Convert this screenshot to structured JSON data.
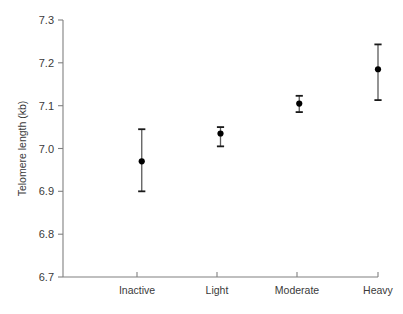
{
  "chart_data": {
    "type": "scatter",
    "title": "",
    "xlabel": "",
    "ylabel": "Telomere length (kb)",
    "categories": [
      "Inactive",
      "Light",
      "Moderate",
      "Heavy"
    ],
    "values": [
      6.97,
      7.035,
      7.105,
      7.185
    ],
    "error_low": [
      6.9,
      7.005,
      7.085,
      7.113
    ],
    "error_high": [
      7.045,
      7.05,
      7.123,
      7.243
    ],
    "ylim": [
      6.7,
      7.3
    ],
    "yticks": [
      6.7,
      6.8,
      6.9,
      7.0,
      7.1,
      7.2,
      7.3
    ],
    "ytick_labels": [
      "6.7",
      "6.8",
      "6.9",
      "7.0",
      "7.1",
      "7.2",
      "7.3"
    ],
    "grid": false,
    "legend": false,
    "marker": "filled-circle",
    "marker_color": "#000000",
    "errorbar_color": "#5a5a5a",
    "axis_color": "#808080",
    "background": "#ffffff",
    "spines": [
      "left",
      "bottom"
    ]
  },
  "axis": {
    "y_title": "Telomere length (kb)"
  },
  "ticks": {
    "y": [
      "7.3",
      "7.2",
      "7.1",
      "7.0",
      "6.9",
      "6.8",
      "6.7"
    ],
    "x": [
      "Inactive",
      "Light",
      "Moderate",
      "Heavy"
    ]
  }
}
